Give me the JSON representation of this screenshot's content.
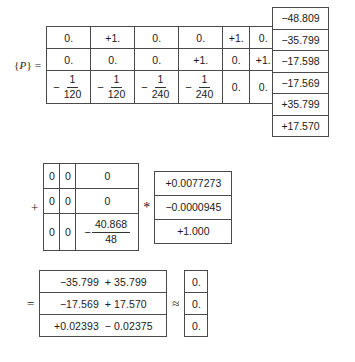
{
  "equation": {
    "label": "{P} =",
    "label_symbol": "P",
    "operators": {
      "multiply": "*",
      "plus": "+",
      "equals": "=",
      "approx": "≈"
    },
    "p_matrix": {
      "rows": [
        [
          "0.",
          "+1.",
          "0.",
          "0.",
          "+1.",
          "0."
        ],
        [
          "0.",
          "0.",
          "0.",
          "+1.",
          "0.",
          "+1."
        ]
      ],
      "fraction_row": {
        "fractions": [
          {
            "sign": "−",
            "numerator": "1",
            "denominator": "120"
          },
          {
            "sign": "−",
            "numerator": "1",
            "denominator": "120"
          },
          {
            "sign": "−",
            "numerator": "1",
            "denominator": "240"
          },
          {
            "sign": "−",
            "numerator": "1",
            "denominator": "240"
          }
        ],
        "tail": [
          "0.",
          "0."
        ]
      }
    },
    "p_vector": {
      "values": [
        "−48.809",
        "−35.799",
        "−17.598",
        "−17.569",
        "+35.799",
        "+17.570"
      ]
    },
    "zero_matrix": {
      "rows": [
        [
          "0",
          "0",
          "0"
        ],
        [
          "0",
          "0",
          "0"
        ]
      ],
      "fraction_row": {
        "leading": [
          "0",
          "0"
        ],
        "fraction": {
          "sign": "−",
          "numerator": "40.868",
          "denominator": "48"
        }
      }
    },
    "coef_vector": {
      "values": [
        "+0.0077273",
        "−0.0000945",
        "+1.000"
      ]
    },
    "result_matrix": {
      "rows": [
        {
          "term1": "−35.799",
          "term2": "+ 35.799"
        },
        {
          "term1": "−17.569",
          "term2": "+ 17.570"
        },
        {
          "term1": "+0.02393",
          "term2": "− 0.02375"
        }
      ]
    },
    "zero_result": {
      "values": [
        "0.",
        "0.",
        "0."
      ]
    }
  }
}
